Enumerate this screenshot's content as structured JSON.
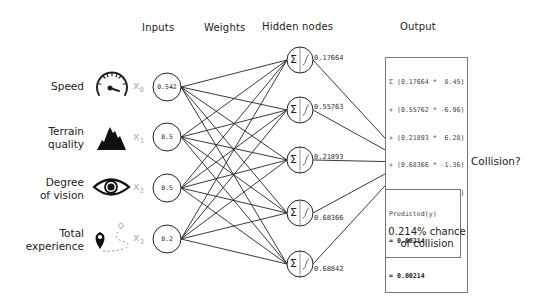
{
  "headers": {
    "inputs": "Inputs",
    "weights": "Weights",
    "hidden": "Hidden nodes",
    "output": "Output"
  },
  "inputs": [
    {
      "label_line1": "Speed",
      "label_line2": "",
      "icon": "speedometer-icon",
      "var": "x",
      "sub": "0",
      "value": "0.542"
    },
    {
      "label_line1": "Terrain",
      "label_line2": "quality",
      "icon": "mountain-icon",
      "var": "x",
      "sub": "1",
      "value": "0.5"
    },
    {
      "label_line1": "Degree",
      "label_line2": "of vision",
      "icon": "eye-icon",
      "var": "x",
      "sub": "2",
      "value": "0.5"
    },
    {
      "label_line1": "Total",
      "label_line2": "experience",
      "icon": "map-pin-route-icon",
      "var": "x",
      "sub": "3",
      "value": "0.2"
    }
  ],
  "hidden_nodes": [
    {
      "value": "0.17664",
      "sum_symbol": "Σ"
    },
    {
      "value": "0.55763",
      "sum_symbol": "Σ"
    },
    {
      "value": "0.21893",
      "sum_symbol": "Σ"
    },
    {
      "value": "0.68366",
      "sum_symbol": "Σ"
    },
    {
      "value": "0.68842",
      "sum_symbol": "Σ"
    }
  ],
  "output": {
    "sum_symbol": "Σ",
    "var": "y",
    "icon": "fire-icon",
    "question": "Collision?",
    "equation_lines": [
      "Σ (0.17664 *  8.45)",
      "+ (0.55762 * -6.96)",
      "+ (0.21893 *  6.28)",
      "+ (0.68366 * -1.36)",
      "+ (0.68842 * -6.10)",
      "=  -6.1426864",
      "∫ (-6.1426864)"
    ],
    "equation_result": "= 0.00214",
    "predicted_label": "Predicted(y)",
    "predicted_value": "= 0.00214",
    "chance_line1": "0.214% chance",
    "chance_line2": "of collision"
  },
  "colors": {
    "line": "#222222",
    "subscript": "#aaaaaa",
    "box_border": "#777777"
  }
}
